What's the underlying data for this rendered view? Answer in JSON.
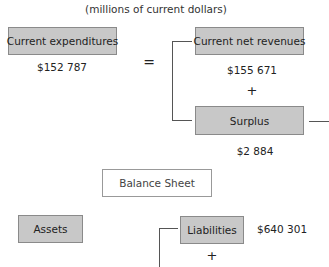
{
  "subtitle": "(millions of current dollars)",
  "income_equation": {
    "left": {
      "label": "Current expenditures",
      "value": "$152 787"
    },
    "operator": "=",
    "right": [
      {
        "label": "Current net revenues",
        "value": "$155 671"
      },
      {
        "operator": "+"
      },
      {
        "label": "Surplus",
        "value": "$2 884"
      }
    ]
  },
  "balance_sheet": {
    "label": "Balance Sheet",
    "assets": {
      "label": "Assets"
    },
    "liabilities": {
      "label": "Liabilities",
      "value": "$640 301"
    },
    "operator": "+"
  }
}
